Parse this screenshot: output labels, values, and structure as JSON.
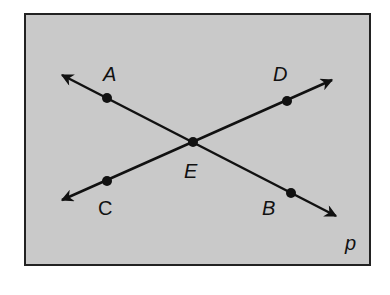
{
  "figure": {
    "background_color": "#c9c9c9",
    "line_color": "#111111",
    "plane_label": "p",
    "points": [
      {
        "id": "A",
        "label": "A"
      },
      {
        "id": "B",
        "label": "B"
      },
      {
        "id": "C",
        "label": "C"
      },
      {
        "id": "D",
        "label": "D"
      },
      {
        "id": "E",
        "label": "E"
      }
    ],
    "lines": [
      {
        "id": "AB",
        "through": [
          "A",
          "E",
          "B"
        ]
      },
      {
        "id": "CD",
        "through": [
          "C",
          "E",
          "D"
        ]
      }
    ],
    "intersection": "E"
  }
}
